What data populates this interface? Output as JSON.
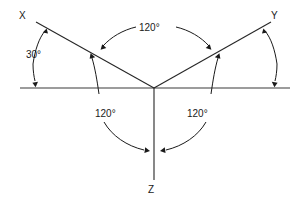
{
  "diagram": {
    "type": "geometry-angle-diagram",
    "colors": {
      "stroke": "#1a1a1a",
      "background": "#ffffff"
    },
    "vertex": {
      "x": 154,
      "y": 88
    },
    "baseline": {
      "x1": 20,
      "y1": 88,
      "x2": 290,
      "y2": 88
    },
    "rays": [
      {
        "name": "ray-x",
        "label": "X",
        "from": [
          154,
          88
        ],
        "to": [
          36,
          22
        ]
      },
      {
        "name": "ray-y",
        "label": "Y",
        "from": [
          154,
          88
        ],
        "to": [
          271,
          22
        ]
      },
      {
        "name": "ray-z",
        "label": "Z",
        "from": [
          154,
          88
        ],
        "to": [
          154,
          180
        ]
      }
    ],
    "labels": {
      "x": "X",
      "y": "Y",
      "z": "Z",
      "angle_30": "30°",
      "angle_120_top": "120°",
      "angle_120_left": "120°",
      "angle_120_right": "120°"
    },
    "angles": [
      {
        "name": "angle-30-left",
        "value": "30°",
        "between": [
          "baseline-left",
          "ray-x"
        ],
        "labeled": true
      },
      {
        "name": "angle-30-right",
        "value": "",
        "between": [
          "ray-y",
          "baseline-right"
        ],
        "labeled": false
      },
      {
        "name": "angle-120-x-y",
        "value": "120°",
        "between": [
          "ray-x",
          "ray-y"
        ],
        "labeled": true
      },
      {
        "name": "angle-120-x-z",
        "value": "120°",
        "between": [
          "ray-x",
          "ray-z"
        ],
        "labeled": true
      },
      {
        "name": "angle-120-y-z",
        "value": "120°",
        "between": [
          "ray-y",
          "ray-z"
        ],
        "labeled": true
      }
    ]
  }
}
